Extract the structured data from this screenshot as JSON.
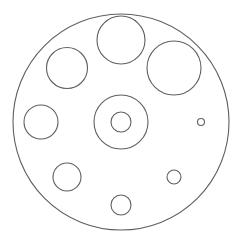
{
  "diagram": {
    "title": "Circular plate with holes",
    "width": 239,
    "height": 245,
    "background": "#ffffff",
    "stroke": "#5f5f5f",
    "stroke_width": 1.1,
    "outer_circle": {
      "cx": 121,
      "cy": 122,
      "r": 108
    },
    "holes": [
      {
        "id": "top",
        "cx": 121,
        "cy": 40,
        "r": 24
      },
      {
        "id": "top-right",
        "cx": 174,
        "cy": 68,
        "r": 27
      },
      {
        "id": "top-left",
        "cx": 67,
        "cy": 68,
        "r": 20.5
      },
      {
        "id": "left",
        "cx": 41,
        "cy": 122,
        "r": 17
      },
      {
        "id": "center-outer",
        "cx": 121,
        "cy": 122,
        "r": 27
      },
      {
        "id": "center-inner",
        "cx": 121,
        "cy": 122,
        "r": 10
      },
      {
        "id": "right-small",
        "cx": 201,
        "cy": 122,
        "r": 3.5
      },
      {
        "id": "bottom-left",
        "cx": 67,
        "cy": 177,
        "r": 14
      },
      {
        "id": "bottom",
        "cx": 121,
        "cy": 205,
        "r": 10
      },
      {
        "id": "bottom-right",
        "cx": 174,
        "cy": 177,
        "r": 7
      }
    ]
  }
}
